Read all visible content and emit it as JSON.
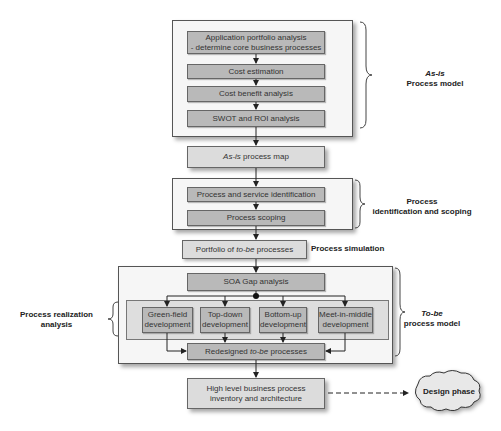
{
  "as_is_section": {
    "steps": [
      "Application portfolio analysis\n- determine core business processes",
      "Cost estimation",
      "Cost benefit analysis",
      "SWOT and ROI analysis"
    ],
    "label_italic": "As-is",
    "label_rest": "Process model"
  },
  "as_is_map": {
    "italic": "As-is",
    "rest": " process map"
  },
  "identification_section": {
    "steps": [
      "Process and service identification",
      "Process scoping"
    ],
    "label": "Process\nidentification and scoping"
  },
  "portfolio": {
    "prefix": "Portfolio of ",
    "italic": "to-be",
    "suffix": " processes"
  },
  "process_simulation_label": "Process simulation",
  "to_be_section": {
    "gap_analysis": "SOA Gap analysis",
    "developments": [
      "Green-field\ndevelopment",
      "Top-down\ndevelopment",
      "Bottom-up\ndevelopment",
      "Meet-in-middle\ndevelopment"
    ],
    "redesigned": {
      "prefix": "Redesigned ",
      "italic": "to-be",
      "suffix": " processes"
    },
    "label_italic": "To-be",
    "label_rest": "process model"
  },
  "realization_label": "Process realization\nanalysis",
  "high_level": "High level business process\ninventory and architecture",
  "design_phase": "Design phase"
}
